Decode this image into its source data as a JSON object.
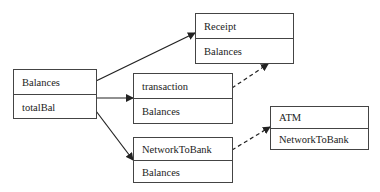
{
  "diagram": {
    "type": "class-relationship",
    "boxes": [
      {
        "id": "balances",
        "title": "Balances",
        "member": "totalBal"
      },
      {
        "id": "receipt",
        "title": "Receipt",
        "member": "Balances"
      },
      {
        "id": "transaction",
        "title": "transaction",
        "member": "Balances"
      },
      {
        "id": "networktobank",
        "title": "NetworkToBank",
        "member": "Balances"
      },
      {
        "id": "atm",
        "title": "ATM",
        "member": "NetworkToBank"
      }
    ],
    "edges": [
      {
        "from": "balances",
        "to": "receipt",
        "style": "solid",
        "arrow": "filled"
      },
      {
        "from": "balances",
        "to": "transaction",
        "style": "solid",
        "arrow": "filled"
      },
      {
        "from": "balances",
        "to": "networktobank",
        "style": "solid",
        "arrow": "filled"
      },
      {
        "from": "transaction",
        "to": "receipt",
        "style": "dashed",
        "arrow": "filled"
      },
      {
        "from": "networktobank",
        "to": "atm",
        "style": "dashed",
        "arrow": "filled"
      }
    ],
    "colors": {
      "line": "#222222",
      "border": "#444444",
      "background": "#ffffff"
    }
  }
}
